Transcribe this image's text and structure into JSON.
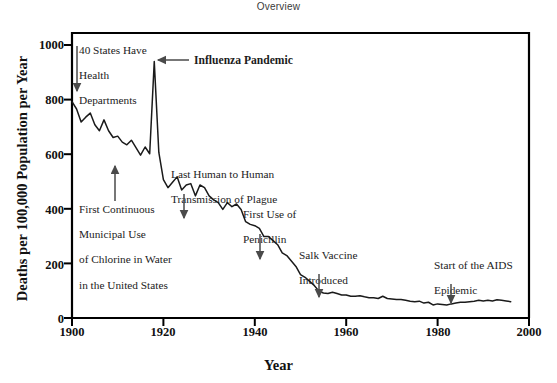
{
  "header": {
    "overview_label": "Overview"
  },
  "chart_data": {
    "type": "line",
    "title": "Overview",
    "xlabel": "Year",
    "ylabel": "Deaths per 100,000 Population per Year",
    "xlim": [
      1900,
      2000
    ],
    "ylim": [
      0,
      1050
    ],
    "grid": false,
    "legend": null,
    "xticks": [
      1900,
      1920,
      1940,
      1960,
      1980,
      2000
    ],
    "yticks": [
      0,
      200,
      400,
      600,
      800,
      1000
    ],
    "series": [
      {
        "name": "Crude death rate for infectious diseases, United States",
        "x": [
          1900,
          1901,
          1902,
          1903,
          1904,
          1905,
          1906,
          1907,
          1908,
          1909,
          1910,
          1911,
          1912,
          1913,
          1914,
          1915,
          1916,
          1917,
          1918,
          1919,
          1920,
          1921,
          1922,
          1923,
          1924,
          1925,
          1926,
          1927,
          1928,
          1929,
          1930,
          1931,
          1932,
          1933,
          1934,
          1935,
          1936,
          1937,
          1938,
          1939,
          1940,
          1941,
          1942,
          1943,
          1944,
          1945,
          1946,
          1947,
          1948,
          1949,
          1950,
          1951,
          1952,
          1953,
          1954,
          1955,
          1956,
          1957,
          1958,
          1959,
          1960,
          1961,
          1962,
          1963,
          1964,
          1965,
          1966,
          1967,
          1968,
          1969,
          1970,
          1971,
          1972,
          1973,
          1974,
          1975,
          1976,
          1977,
          1978,
          1979,
          1980,
          1981,
          1982,
          1983,
          1984,
          1985,
          1986,
          1987,
          1988,
          1989,
          1990,
          1991,
          1992,
          1993,
          1994,
          1995,
          1996
        ],
        "y": [
          797,
          770,
          722,
          740,
          755,
          712,
          690,
          730,
          690,
          665,
          670,
          648,
          638,
          655,
          628,
          600,
          630,
          605,
          945,
          610,
          510,
          480,
          500,
          520,
          472,
          490,
          495,
          450,
          490,
          480,
          450,
          435,
          425,
          400,
          425,
          410,
          420,
          400,
          355,
          345,
          340,
          330,
          300,
          300,
          285,
          270,
          240,
          230,
          210,
          190,
          160,
          150,
          135,
          120,
          100,
          92,
          90,
          95,
          90,
          85,
          85,
          80,
          80,
          82,
          78,
          75,
          75,
          72,
          80,
          72,
          70,
          68,
          68,
          65,
          62,
          60,
          62,
          55,
          58,
          48,
          52,
          50,
          48,
          52,
          55,
          58,
          58,
          60,
          62,
          65,
          63,
          65,
          63,
          67,
          65,
          63,
          60
        ]
      }
    ],
    "annotations": [
      {
        "id": "health-departments",
        "lines": [
          "40 States Have",
          "Health",
          "Departments"
        ],
        "bold": false,
        "arrow": "down",
        "target_year": 1900,
        "target_value": 797
      },
      {
        "id": "influenza-pandemic",
        "lines": [
          "Influenza Pandemic"
        ],
        "bold": true,
        "arrow": "left",
        "target_year": 1918,
        "target_value": 945
      },
      {
        "id": "chlorine-water",
        "lines": [
          "First Continuous",
          "Municipal Use",
          "of Chlorine in Water",
          "in the United States"
        ],
        "bold": false,
        "arrow": "up",
        "target_year": 1909,
        "target_value": 600
      },
      {
        "id": "plague-transmission",
        "lines": [
          "Last Human to Human",
          "Transmission of Plague"
        ],
        "bold": false,
        "arrow": "down",
        "target_year": 1924,
        "target_value": 490
      },
      {
        "id": "penicillin",
        "lines": [
          "First Use of",
          "Penicillin"
        ],
        "bold": false,
        "arrow": "down",
        "target_year": 1943,
        "target_value": 300
      },
      {
        "id": "salk-vaccine",
        "lines": [
          "Salk Vaccine",
          "Introduced"
        ],
        "bold": false,
        "arrow": "down",
        "target_year": 1955,
        "target_value": 92
      },
      {
        "id": "aids-epidemic",
        "lines": [
          "Start of the AIDS",
          "Epidemic"
        ],
        "bold": false,
        "arrow": "down",
        "target_year": 1981,
        "target_value": 50
      }
    ],
    "colors": {
      "line": "#1a1a1a",
      "axis": "#000000",
      "text": "#111111",
      "background": "#ffffff"
    }
  },
  "axes": {
    "ytick_labels": [
      "1000",
      "800",
      "600",
      "400",
      "200",
      "0"
    ],
    "xtick_labels": [
      "1900",
      "1920",
      "1940",
      "1960",
      "1980",
      "2000"
    ]
  },
  "annotation_text": {
    "health_departments_l1": "40 States Have",
    "health_departments_l2": "Health",
    "health_departments_l3": "Departments",
    "influenza": "Influenza Pandemic",
    "chlorine_l1": "First Continuous",
    "chlorine_l2": "Municipal Use",
    "chlorine_l3": "of Chlorine in Water",
    "chlorine_l4": "in the United States",
    "plague_l1": "Last Human to Human",
    "plague_l2": "Transmission of Plague",
    "penicillin_l1": "First Use of",
    "penicillin_l2": "Penicillin",
    "salk_l1": "Salk Vaccine",
    "salk_l2": "Introduced",
    "aids_l1": "Start of the AIDS",
    "aids_l2": "Epidemic"
  }
}
